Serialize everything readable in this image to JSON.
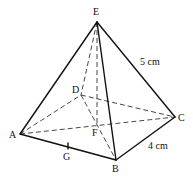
{
  "diagram": {
    "type": "square-based pyramid",
    "vertices": {
      "E": {
        "label": "E",
        "x": 97,
        "y": 22
      },
      "A": {
        "label": "A",
        "x": 20,
        "y": 134
      },
      "B": {
        "label": "B",
        "x": 116,
        "y": 160
      },
      "C": {
        "label": "C",
        "x": 175,
        "y": 117
      },
      "D": {
        "label": "D",
        "x": 81,
        "y": 95
      },
      "F": {
        "label": "F",
        "x": 97,
        "y": 124
      },
      "G": {
        "label": "G",
        "x": 68,
        "y": 146
      }
    },
    "measurements": {
      "EC": "5 cm",
      "BC": "4 cm"
    },
    "colors": {
      "line": "#111111",
      "background": "#ffffff"
    }
  }
}
